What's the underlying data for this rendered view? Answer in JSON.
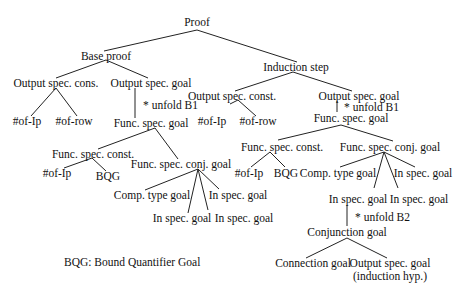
{
  "diagram": {
    "nodes": {
      "proof": "Proof",
      "base_proof": "Base proof",
      "induction_step": "Induction step",
      "b_osc": "Output spec. cons.",
      "b_osg": "Output spec. goal",
      "b_ofip": "#of-Ip",
      "b_ofrow": "#of-row",
      "b_fsg": "Func. spec. goal",
      "b_fsc": "Func. spec. const.",
      "b_fscg": "Func. spec. conj. goal",
      "b_fsc_ofip": "#of-Ip",
      "b_fsc_bqg": "BQG",
      "b_ctg": "Comp. type goal",
      "b_isg1": "In spec. goal",
      "b_isg2": "In spec. goal",
      "b_isg3": "In spec. goal",
      "i_osc": "Output spec. const.",
      "i_osg": "Output spec. goal",
      "i_ofip": "#of-Ip",
      "i_ofrow": "#of-row",
      "i_fsg": "Func. spec. goal",
      "i_fsc": "Func. spec. const.",
      "i_fscg": "Func. spec. conj. goal",
      "i_fsc_ofip": "#of-Ip",
      "i_fsc_bqg": "BQG",
      "i_ctg": "Comp. type goal",
      "i_isg_right": "In spec. goal",
      "i_isg_a": "In spec. goal",
      "i_isg_b": "In spec. goal",
      "i_conj": "Conjunction goal",
      "i_conn": "Connection goal",
      "i_osg_hyp_line1": "Output spec. goal",
      "i_osg_hyp_line2": "(induction hyp.)"
    },
    "annotations": {
      "b_unfold": "* unfold B1",
      "i_unfold": "* unfold B1",
      "i_unfold2": "* unfold B2"
    },
    "legend": "BQG: Bound Quantifier Goal"
  }
}
